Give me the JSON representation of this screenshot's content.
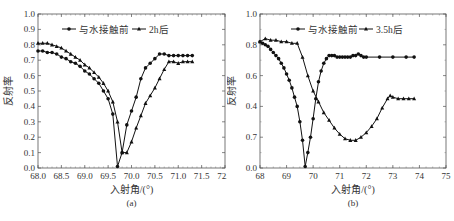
{
  "chart_data": [
    {
      "type": "line",
      "panel_label": "(a)",
      "title": "",
      "xlabel": "入射角/(°)",
      "ylabel": "反射率",
      "xlim": [
        68.0,
        72.0
      ],
      "ylim": [
        0.0,
        1.0
      ],
      "x_ticks": [
        "68.0",
        "68.5",
        "69.0",
        "69.5",
        "70.0",
        "70.5",
        "71.0",
        "71.5",
        "72.0"
      ],
      "y_ticks": [
        "0.0",
        "0.1",
        "0.2",
        "0.3",
        "0.4",
        "0.5",
        "0.6",
        "0.7",
        "0.8",
        "0.9",
        "1.0"
      ],
      "grid": false,
      "legend_position": "top-left-inside",
      "series": [
        {
          "name": "与水接触前",
          "marker": "circle",
          "x": [
            68.0,
            68.1,
            68.2,
            68.3,
            68.4,
            68.5,
            68.6,
            68.7,
            68.8,
            68.9,
            69.0,
            69.1,
            69.2,
            69.3,
            69.4,
            69.5,
            69.6,
            69.7,
            69.8,
            69.9,
            70.0,
            70.1,
            70.2,
            70.3,
            70.4,
            70.5,
            70.6,
            70.7,
            70.8,
            70.9,
            71.0,
            71.1,
            71.2,
            71.3
          ],
          "values": [
            0.76,
            0.76,
            0.75,
            0.75,
            0.74,
            0.72,
            0.71,
            0.69,
            0.68,
            0.66,
            0.63,
            0.61,
            0.58,
            0.55,
            0.5,
            0.45,
            0.35,
            0.01,
            0.1,
            0.28,
            0.37,
            0.46,
            0.58,
            0.65,
            0.68,
            0.71,
            0.74,
            0.74,
            0.73,
            0.73,
            0.73,
            0.73,
            0.73,
            0.73
          ]
        },
        {
          "name": "2h后",
          "marker": "triangle",
          "x": [
            68.0,
            68.1,
            68.2,
            68.3,
            68.4,
            68.5,
            68.6,
            68.7,
            68.8,
            68.9,
            69.0,
            69.1,
            69.2,
            69.3,
            69.4,
            69.5,
            69.6,
            69.7,
            69.8,
            69.9,
            70.0,
            70.1,
            70.2,
            70.3,
            70.4,
            70.5,
            70.6,
            70.7,
            70.8,
            70.9,
            71.0,
            71.1,
            71.2,
            71.3
          ],
          "values": [
            0.81,
            0.81,
            0.81,
            0.8,
            0.79,
            0.78,
            0.76,
            0.74,
            0.72,
            0.7,
            0.67,
            0.65,
            0.62,
            0.59,
            0.55,
            0.5,
            0.43,
            0.3,
            0.1,
            0.1,
            0.17,
            0.26,
            0.34,
            0.42,
            0.47,
            0.52,
            0.58,
            0.64,
            0.69,
            0.69,
            0.68,
            0.69,
            0.69,
            0.69
          ]
        }
      ]
    },
    {
      "type": "line",
      "panel_label": "(b)",
      "title": "",
      "xlabel": "入射角/(°)",
      "ylabel": "反射率",
      "xlim": [
        68,
        75
      ],
      "ylim": [
        0.0,
        1.0
      ],
      "x_ticks": [
        "68",
        "69",
        "70",
        "71",
        "72",
        "73",
        "74",
        "75"
      ],
      "y_ticks": [
        "0.0",
        "0.2",
        "0.4",
        "0.6",
        "0.8",
        "1.0"
      ],
      "y_tick_note": "tick at 0.2 printed as '0.7' in the figure",
      "grid": false,
      "legend_position": "top-center-inside",
      "series": [
        {
          "name": "与水接触前",
          "marker": "circle",
          "x": [
            68.0,
            68.1,
            68.2,
            68.3,
            68.4,
            68.5,
            68.6,
            68.7,
            68.8,
            68.9,
            69.0,
            69.1,
            69.2,
            69.3,
            69.4,
            69.5,
            69.6,
            69.7,
            69.8,
            69.9,
            70.0,
            70.1,
            70.2,
            70.3,
            70.4,
            70.5,
            70.6,
            70.7,
            70.8,
            70.9,
            71.0,
            71.1,
            71.2,
            71.3,
            71.4,
            71.5,
            71.6,
            71.7,
            71.8,
            71.9,
            72.0,
            72.5,
            73.0,
            73.5,
            73.8
          ],
          "values": [
            0.82,
            0.81,
            0.8,
            0.79,
            0.77,
            0.75,
            0.73,
            0.71,
            0.68,
            0.65,
            0.61,
            0.57,
            0.52,
            0.46,
            0.4,
            0.3,
            0.18,
            0.01,
            0.1,
            0.2,
            0.32,
            0.45,
            0.56,
            0.63,
            0.68,
            0.71,
            0.73,
            0.73,
            0.73,
            0.72,
            0.72,
            0.72,
            0.72,
            0.72,
            0.72,
            0.73,
            0.73,
            0.74,
            0.73,
            0.72,
            0.72,
            0.72,
            0.72,
            0.72,
            0.72
          ]
        },
        {
          "name": "3.5h后",
          "marker": "triangle",
          "x": [
            68.0,
            68.2,
            68.4,
            68.6,
            68.8,
            69.0,
            69.2,
            69.4,
            69.6,
            69.8,
            70.0,
            70.2,
            70.4,
            70.6,
            70.8,
            71.0,
            71.2,
            71.4,
            71.6,
            71.8,
            72.0,
            72.2,
            72.4,
            72.6,
            72.8,
            72.9,
            73.0,
            73.2,
            73.4,
            73.6,
            73.8
          ],
          "values": [
            0.82,
            0.84,
            0.83,
            0.83,
            0.82,
            0.82,
            0.81,
            0.81,
            0.72,
            0.6,
            0.5,
            0.43,
            0.36,
            0.31,
            0.26,
            0.22,
            0.19,
            0.18,
            0.18,
            0.2,
            0.23,
            0.27,
            0.32,
            0.39,
            0.45,
            0.47,
            0.46,
            0.45,
            0.45,
            0.45,
            0.45
          ]
        }
      ]
    }
  ]
}
